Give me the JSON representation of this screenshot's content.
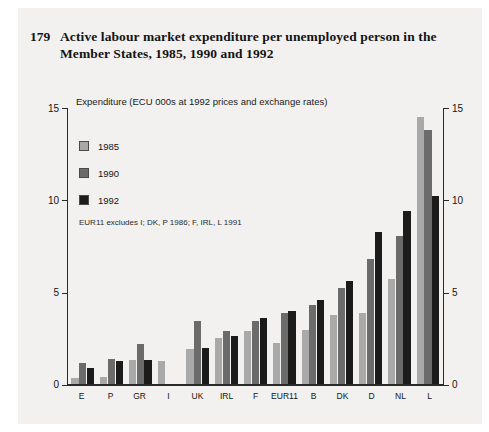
{
  "figure": {
    "number": "179",
    "title": "Active labour market expenditure per unemployed person in the Member States, 1985, 1990 and 1992",
    "subtitle": "Expenditure (ECU 000s at 1992 prices and exchange rates)",
    "note": "EUR11 excludes I; DK, P 1986; F, IRL, L 1991"
  },
  "colors": {
    "series_1985": "#a9a9a9",
    "series_1990": "#6b6b6b",
    "series_1992": "#1b1b1b",
    "panel": "#f2f1ef",
    "axis": "#2a2a2a"
  },
  "axis": {
    "y_ticks": [
      "0",
      "5",
      "10",
      "15"
    ],
    "y_ticks_right": [
      "0",
      "5",
      "10",
      "15"
    ]
  },
  "chart_data": {
    "type": "bar",
    "title": "Active labour market expenditure per unemployed person in the Member States, 1985, 1990 and 1992",
    "subtitle": "Expenditure (ECU 000s at 1992 prices and exchange rates)",
    "annotation": "EUR11 excludes I; DK, P 1986; F, IRL, L 1991",
    "xlabel": "",
    "ylabel": "Expenditure (ECU 000s at 1992 prices and exchange rates)",
    "ylim": [
      0,
      15
    ],
    "yticks": [
      0,
      5,
      10,
      15
    ],
    "grid": false,
    "legend_position": "upper-left-inside",
    "categories": [
      "E",
      "P",
      "GR",
      "I",
      "UK",
      "IRL",
      "F",
      "EUR11",
      "B",
      "DK",
      "D",
      "NL",
      "L"
    ],
    "series": [
      {
        "name": "1985",
        "color": "#a9a9a9",
        "values": [
          0.35,
          0.4,
          1.35,
          1.25,
          1.9,
          2.5,
          2.9,
          2.25,
          2.95,
          3.75,
          3.85,
          5.7,
          14.5
        ]
      },
      {
        "name": "1990",
        "color": "#6b6b6b",
        "values": [
          1.15,
          1.4,
          2.2,
          null,
          3.45,
          2.9,
          3.45,
          3.85,
          4.3,
          5.25,
          6.8,
          8.05,
          13.8
        ]
      },
      {
        "name": "1992",
        "color": "#1b1b1b",
        "values": [
          0.9,
          1.25,
          1.35,
          null,
          2.0,
          2.65,
          3.6,
          4.0,
          4.6,
          5.6,
          8.25,
          9.4,
          10.2
        ]
      }
    ]
  }
}
